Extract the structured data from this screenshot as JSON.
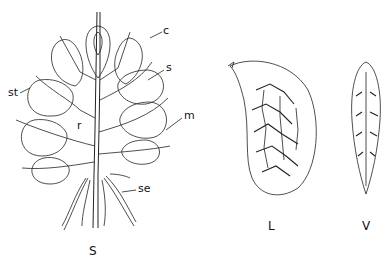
{
  "figure": {
    "panels": [
      {
        "id": "S",
        "caption": "S",
        "description": "whole inflorescence/fruiting spike with stalked capsules"
      },
      {
        "id": "L",
        "caption": "L",
        "description": "seed, lateral view with reticulate surface"
      },
      {
        "id": "V",
        "caption": "V",
        "description": "seed, ventral view"
      }
    ],
    "labels": {
      "c": "c",
      "s": "s",
      "st": "st",
      "r": "r",
      "m": "m",
      "se": "se"
    }
  }
}
